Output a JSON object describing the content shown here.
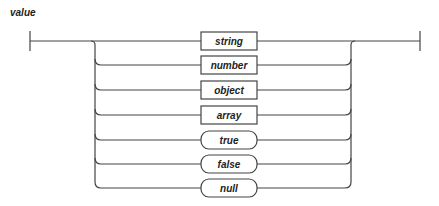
{
  "diagram": {
    "title": "value",
    "type": "railroad",
    "alternatives": [
      {
        "label": "string",
        "kind": "nonterminal"
      },
      {
        "label": "number",
        "kind": "nonterminal"
      },
      {
        "label": "object",
        "kind": "nonterminal"
      },
      {
        "label": "array",
        "kind": "nonterminal"
      },
      {
        "label": "true",
        "kind": "terminal"
      },
      {
        "label": "false",
        "kind": "terminal"
      },
      {
        "label": "null",
        "kind": "terminal"
      }
    ]
  }
}
